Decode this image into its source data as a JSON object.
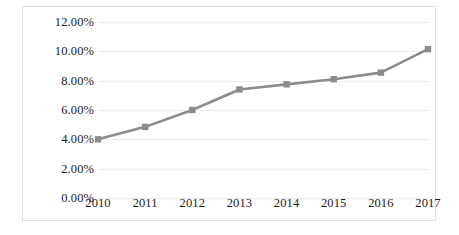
{
  "chart_data": {
    "type": "line",
    "title": "",
    "subtitle": "",
    "xlabel": "",
    "ylabel": "",
    "categories": [
      "2010",
      "2011",
      "2012",
      "2013",
      "2014",
      "2015",
      "2016",
      "2017"
    ],
    "values": [
      4.0,
      4.85,
      6.0,
      7.4,
      7.75,
      8.1,
      8.55,
      10.15
    ],
    "value_format": "percent",
    "ylim": [
      0,
      12
    ],
    "yticks": [
      0,
      2,
      4,
      6,
      8,
      10,
      12
    ],
    "ytick_labels": [
      "0.00%",
      "2.00%",
      "4.00%",
      "6.00%",
      "8.00%",
      "10.00%",
      "12.00%"
    ],
    "series": [
      {
        "name": "",
        "values": [
          4.0,
          4.85,
          6.0,
          7.4,
          7.75,
          8.1,
          8.55,
          10.15
        ],
        "color": "#8c8c8c",
        "marker": "square",
        "marker_color": "#8c8c8c"
      }
    ],
    "grid": true,
    "grid_color": "#ececec",
    "legend": false,
    "legend_position": "none",
    "border_color": "#e2e2e2",
    "background": "#ffffff",
    "annotations": []
  }
}
